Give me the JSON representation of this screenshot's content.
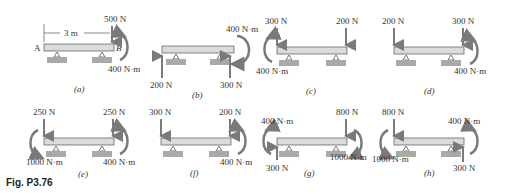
{
  "figure": {
    "label": "Fig. P3.76",
    "dimension": "3 m",
    "point_a": "A",
    "point_b": "B",
    "colors": {
      "beam_fill": "#d9dcdc",
      "beam_stroke": "#555555",
      "support": "#a8aaa6",
      "arrow": "#7a7a7a",
      "text": "#333333"
    },
    "panels": [
      {
        "caption": "(a)",
        "loads": [
          "500 N",
          "400 N·m"
        ]
      },
      {
        "caption": "(b)",
        "loads": [
          "400 N·m",
          "200 N",
          "300 N"
        ]
      },
      {
        "caption": "(c)",
        "loads": [
          "300 N",
          "200 N",
          "400 N·m"
        ]
      },
      {
        "caption": "(d)",
        "loads": [
          "200 N",
          "300 N",
          "400 N·m"
        ]
      },
      {
        "caption": "(e)",
        "loads": [
          "250 N",
          "250 N",
          "1000 N·m",
          "400 N·m"
        ]
      },
      {
        "caption": "(f)",
        "loads": [
          "300 N",
          "200 N",
          "400 N·m"
        ]
      },
      {
        "caption": "(g)",
        "loads": [
          "400 N·m",
          "800 N",
          "300 N",
          "1000 N·m"
        ]
      },
      {
        "caption": "(h)",
        "loads": [
          "800 N",
          "400 N·m",
          "1000 N·m",
          "300 N"
        ]
      }
    ]
  }
}
